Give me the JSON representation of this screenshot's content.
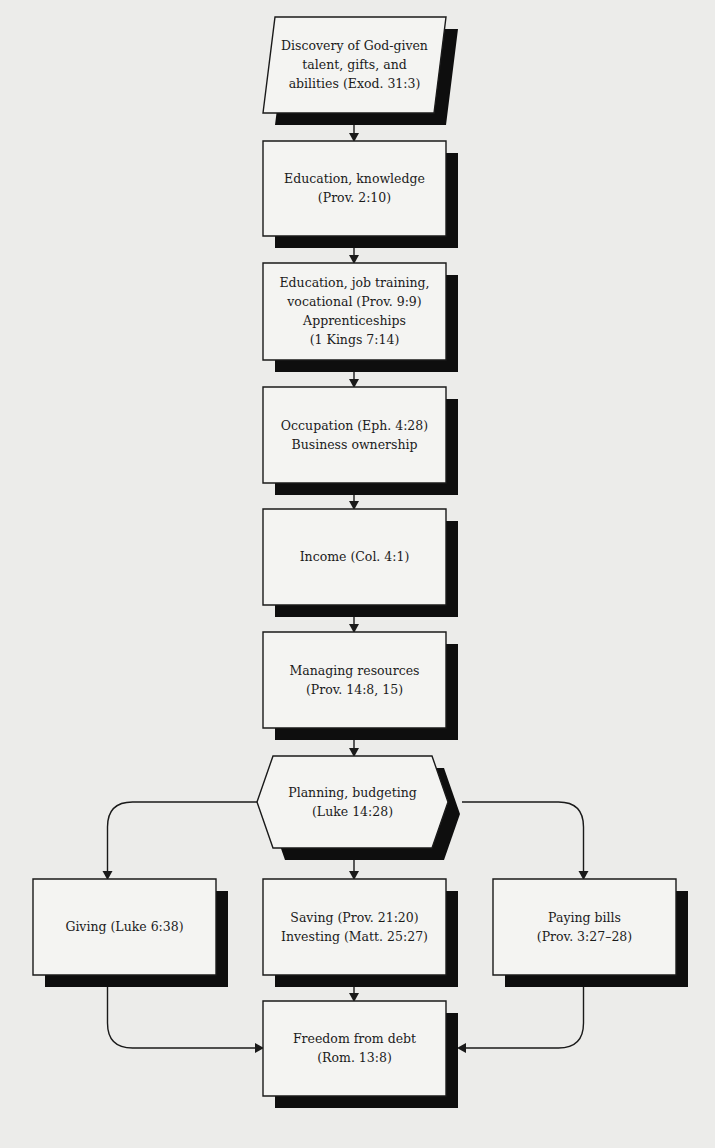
{
  "diagram": {
    "type": "flowchart",
    "nodes": [
      {
        "id": "discovery",
        "shape": "parallelogram",
        "lines": [
          "Discovery of God-given",
          "talent, gifts, and",
          "abilities (Exod. 31:3)"
        ]
      },
      {
        "id": "education-knowledge",
        "shape": "rectangle",
        "lines": [
          "Education, knowledge",
          "(Prov. 2:10)"
        ]
      },
      {
        "id": "job-training",
        "shape": "rectangle",
        "lines": [
          "Education, job training,",
          "vocational (Prov. 9:9)",
          "Apprenticeships",
          "(1 Kings 7:14)"
        ]
      },
      {
        "id": "occupation",
        "shape": "rectangle",
        "lines": [
          "Occupation (Eph. 4:28)",
          "Business ownership"
        ]
      },
      {
        "id": "income",
        "shape": "rectangle",
        "lines": [
          "Income (Col. 4:1)"
        ]
      },
      {
        "id": "managing-resources",
        "shape": "rectangle",
        "lines": [
          "Managing resources",
          "(Prov. 14:8, 15)"
        ]
      },
      {
        "id": "planning-budgeting",
        "shape": "hexagon",
        "lines": [
          "Planning, budgeting",
          "(Luke 14:28)"
        ]
      },
      {
        "id": "giving",
        "shape": "rectangle",
        "lines": [
          "Giving (Luke 6:38)"
        ]
      },
      {
        "id": "saving-investing",
        "shape": "rectangle",
        "lines": [
          "Saving (Prov. 21:20)",
          "Investing (Matt. 25:27)"
        ]
      },
      {
        "id": "paying-bills",
        "shape": "rectangle",
        "lines": [
          "Paying bills",
          "(Prov. 3:27–28)"
        ]
      },
      {
        "id": "freedom-from-debt",
        "shape": "rectangle",
        "lines": [
          "Freedom from debt",
          "(Rom. 13:8)"
        ]
      }
    ],
    "edges": [
      {
        "from": "discovery",
        "to": "education-knowledge"
      },
      {
        "from": "education-knowledge",
        "to": "job-training"
      },
      {
        "from": "job-training",
        "to": "occupation"
      },
      {
        "from": "occupation",
        "to": "income"
      },
      {
        "from": "income",
        "to": "managing-resources"
      },
      {
        "from": "managing-resources",
        "to": "planning-budgeting"
      },
      {
        "from": "planning-budgeting",
        "to": "giving"
      },
      {
        "from": "planning-budgeting",
        "to": "saving-investing"
      },
      {
        "from": "planning-budgeting",
        "to": "paying-bills"
      },
      {
        "from": "giving",
        "to": "freedom-from-debt"
      },
      {
        "from": "saving-investing",
        "to": "freedom-from-debt"
      },
      {
        "from": "paying-bills",
        "to": "freedom-from-debt"
      }
    ]
  }
}
